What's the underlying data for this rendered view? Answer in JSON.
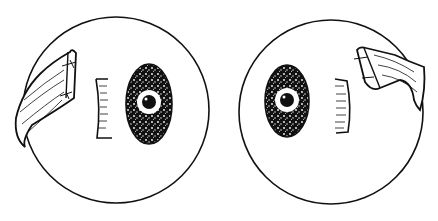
{
  "figure": {
    "background": "#ffffff",
    "ink": "#111111",
    "panels": [
      {
        "name": "left-globe",
        "cx": 116,
        "cy": 110,
        "r": 93,
        "muscle_side": "left"
      },
      {
        "name": "right-globe",
        "cx": 331,
        "cy": 112,
        "r": 92,
        "muscle_side": "right"
      }
    ]
  }
}
